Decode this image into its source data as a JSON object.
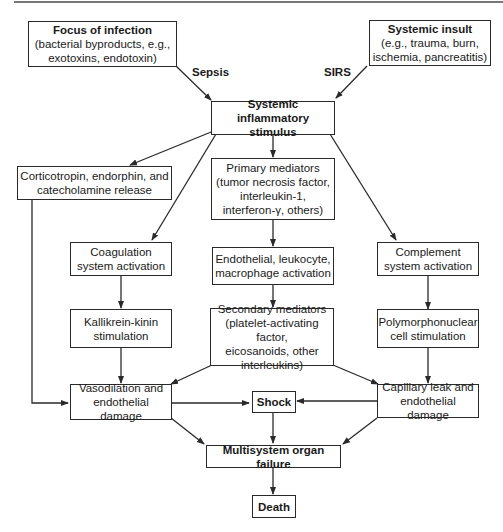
{
  "nodes": {
    "focus": {
      "title": "Focus of infection",
      "lines": [
        "(bacterial byproducts, e.g.,",
        "exotoxins, endotoxin)"
      ]
    },
    "insult": {
      "title": "Systemic insult",
      "lines": [
        "(e.g., trauma, burn,",
        "ischemia, pancreatitis)"
      ]
    },
    "stimulus": {
      "lines": [
        "Systemic inflammatory",
        "stimulus"
      ]
    },
    "cortico": {
      "lines": [
        "Corticotropin, endorphin, and",
        "catecholamine release"
      ]
    },
    "primary": {
      "lines": [
        "Primary mediators",
        "(tumor necrosis factor,",
        "interleukin-1,",
        "interferon-γ, others)"
      ]
    },
    "coag": {
      "lines": [
        "Coagulation",
        "system activation"
      ]
    },
    "endo": {
      "lines": [
        "Endothelial, leukocyte,",
        "macrophage activation"
      ]
    },
    "complement": {
      "lines": [
        "Complement",
        "system activation"
      ]
    },
    "kallikrein": {
      "lines": [
        "Kallikrein-kinin",
        "stimulation"
      ]
    },
    "secondary": {
      "lines": [
        "Secondary mediators",
        "(platelet-activating factor,",
        "eicosanoids, other",
        "interleukins)"
      ]
    },
    "pmn": {
      "lines": [
        "Polymorphonuclear",
        "cell stimulation"
      ]
    },
    "vaso": {
      "lines": [
        "Vasodilation and",
        "endothelial damage"
      ]
    },
    "shock": {
      "lines": [
        "Shock"
      ]
    },
    "capillary": {
      "lines": [
        "Capillary leak and",
        "endothelial damage"
      ]
    },
    "mof": {
      "lines": [
        "Multisystem organ failure"
      ]
    },
    "death": {
      "lines": [
        "Death"
      ]
    }
  },
  "edge_labels": {
    "sepsis": "Sepsis",
    "sirs": "SIRS"
  },
  "colors": {
    "line": "#2a2a2a",
    "background": "#ffffff"
  }
}
